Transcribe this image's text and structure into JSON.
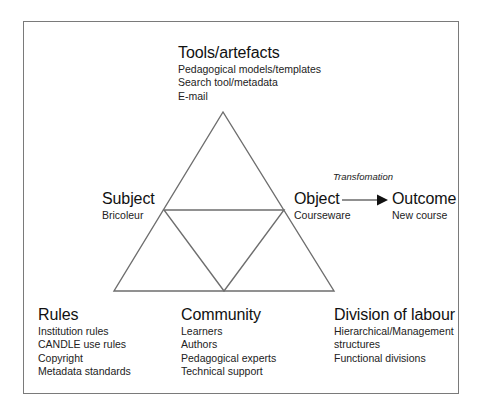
{
  "diagram": {
    "type": "activity-system-triangle",
    "nodes": {
      "tools": {
        "title": "Tools/artefacts",
        "items": [
          "Pedagogical models/templates",
          "Search tool/metadata",
          "E-mail"
        ]
      },
      "subject": {
        "title": "Subject",
        "items": [
          "Bricoleur"
        ]
      },
      "object": {
        "title": "Object",
        "items": [
          "Courseware"
        ]
      },
      "outcome": {
        "title": "Outcome",
        "items": [
          "New course"
        ]
      },
      "rules": {
        "title": "Rules",
        "items": [
          "Institution rules",
          "CANDLE use rules",
          "Copyright",
          "Metadata standards"
        ]
      },
      "community": {
        "title": "Community",
        "items": [
          "Learners",
          "Authors",
          "Pedagogical experts",
          "Technical support"
        ]
      },
      "division": {
        "title": "Division of labour",
        "items": [
          "Hierarchical/Management",
          "structures",
          "Functional divisions"
        ]
      }
    },
    "arrow_label": "Transfomation",
    "colors": {
      "line": "#6e6e6e",
      "frame": "#7a7a7a",
      "text": "#111111",
      "arrow": "#111111"
    }
  }
}
